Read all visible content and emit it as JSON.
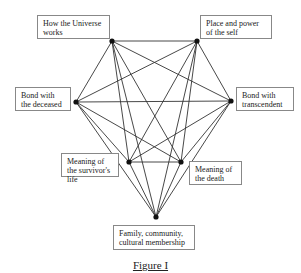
{
  "diagram": {
    "caption": "Figure I",
    "nodes": [
      {
        "id": "A",
        "label": "How the Universe works",
        "x": 112,
        "y": 41
      },
      {
        "id": "B",
        "label": "Place and power of the self",
        "x": 197,
        "y": 41
      },
      {
        "id": "C",
        "label": "Bond with the deceased",
        "x": 76,
        "y": 102
      },
      {
        "id": "D",
        "label": "Bond with transcendent",
        "x": 231,
        "y": 101
      },
      {
        "id": "E",
        "label": "Meaning of the survivor's life",
        "x": 129,
        "y": 162
      },
      {
        "id": "F",
        "label": "Meaning of the death",
        "x": 181,
        "y": 162
      },
      {
        "id": "G",
        "label": "Family, community, cultural membership",
        "x": 156,
        "y": 217
      }
    ],
    "edges": "complete graph: every node connected to every other node"
  },
  "labels": {
    "a": "How the Universe works",
    "b": "Place and power of the self",
    "c": "Bond with the deceased",
    "d": "Bond with transcendent",
    "e": "Meaning of the survivor's life",
    "f": "Meaning of the death",
    "g": "Family, community, cultural membership"
  }
}
